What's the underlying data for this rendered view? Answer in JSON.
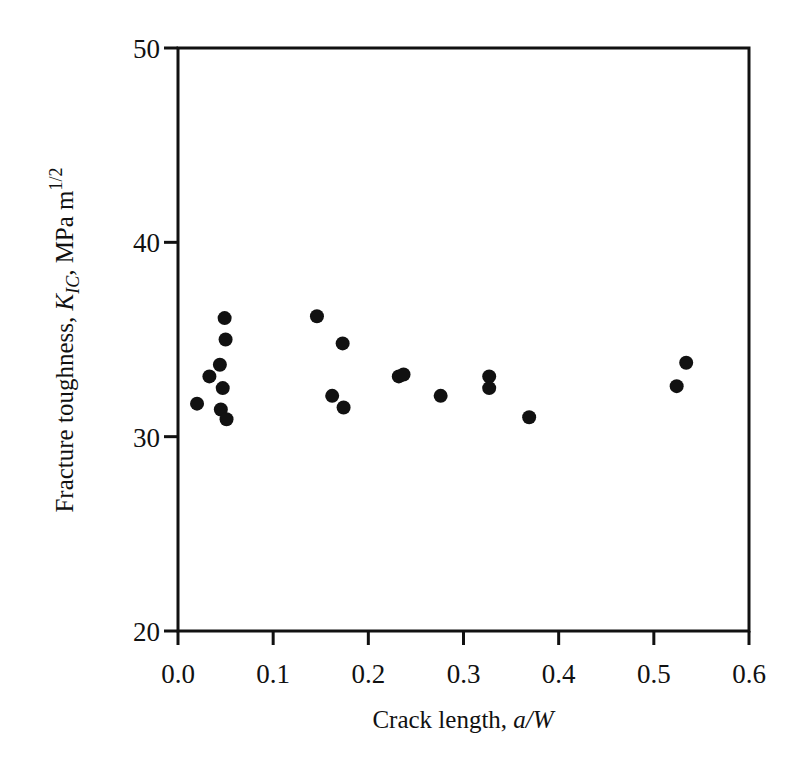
{
  "chart_data": {
    "type": "scatter",
    "title": "",
    "xlabel": "Crack length, a/W",
    "xlabel_parts": {
      "plain": "Crack length, ",
      "italic": "a/W"
    },
    "ylabel": "Fracture toughness, K_IC, MPa m^1/2",
    "ylabel_parts": {
      "plain": "Fracture toughness, ",
      "symbol": "K",
      "subscript": "IC",
      "after": ", MPa m",
      "superscript": "1/2"
    },
    "xlim": [
      0.0,
      0.6
    ],
    "ylim": [
      20,
      50
    ],
    "xticks": [
      0.0,
      0.1,
      0.2,
      0.3,
      0.4,
      0.5,
      0.6
    ],
    "xtick_labels": [
      "0.0",
      "0.1",
      "0.2",
      "0.3",
      "0.4",
      "0.5",
      "0.6"
    ],
    "yticks": [
      20,
      30,
      40,
      50
    ],
    "ytick_labels": [
      "20",
      "30",
      "40",
      "50"
    ],
    "grid": false,
    "legend": null,
    "marker": {
      "shape": "circle",
      "filled": true,
      "color": "#111111"
    },
    "series": [
      {
        "name": "K_IC measurements",
        "points": [
          {
            "x": 0.02,
            "y": 31.7
          },
          {
            "x": 0.033,
            "y": 33.1
          },
          {
            "x": 0.044,
            "y": 33.7
          },
          {
            "x": 0.045,
            "y": 31.4
          },
          {
            "x": 0.047,
            "y": 32.5
          },
          {
            "x": 0.049,
            "y": 36.1
          },
          {
            "x": 0.05,
            "y": 35.0
          },
          {
            "x": 0.051,
            "y": 30.9
          },
          {
            "x": 0.146,
            "y": 36.2
          },
          {
            "x": 0.162,
            "y": 32.1
          },
          {
            "x": 0.173,
            "y": 34.8
          },
          {
            "x": 0.174,
            "y": 31.5
          },
          {
            "x": 0.232,
            "y": 33.1
          },
          {
            "x": 0.237,
            "y": 33.2
          },
          {
            "x": 0.276,
            "y": 32.1
          },
          {
            "x": 0.327,
            "y": 33.1
          },
          {
            "x": 0.327,
            "y": 32.5
          },
          {
            "x": 0.369,
            "y": 31.0
          },
          {
            "x": 0.524,
            "y": 32.6
          },
          {
            "x": 0.534,
            "y": 33.8
          }
        ]
      }
    ]
  },
  "colors": {
    "ink": "#111111",
    "background": "#ffffff"
  }
}
